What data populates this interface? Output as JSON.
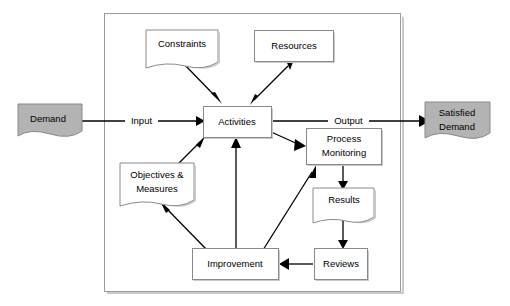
{
  "diagram": {
    "type": "process-flow-diagram",
    "colors": {
      "wave_fill": "#b3b3b3",
      "box_fill": "#ffffff",
      "box_stroke": "#8a8a8a",
      "container_stroke": "#9a9a9a",
      "connector": "#000000",
      "shadow": "#c9c9c9"
    },
    "container": {
      "name": "process-boundary",
      "x": 104,
      "y": 13,
      "width": 296,
      "height": 278
    },
    "nodes": [
      {
        "id": "demand",
        "label": "Demand",
        "shape": "wave",
        "fill": "#b3b3b3",
        "x": 18,
        "y": 104,
        "width": 64,
        "height": 34
      },
      {
        "id": "constraints",
        "label": "Constraints",
        "shape": "document",
        "fill": "#ffffff",
        "x": 146,
        "y": 30,
        "width": 72,
        "height": 32
      },
      {
        "id": "resources",
        "label": "Resources",
        "shape": "rect",
        "fill": "#ffffff",
        "x": 254,
        "y": 30,
        "width": 79,
        "height": 31
      },
      {
        "id": "activities",
        "label": "Activities",
        "shape": "rect",
        "fill": "#ffffff",
        "x": 203,
        "y": 106,
        "width": 68,
        "height": 31
      },
      {
        "id": "process-monitoring",
        "label_line_1": "Process",
        "label_line_2": "Monitoring",
        "label": "Process Monitoring",
        "shape": "rect",
        "fill": "#ffffff",
        "x": 306,
        "y": 128,
        "width": 75,
        "height": 36
      },
      {
        "id": "objectives-measures",
        "label_line_1": "Objectives &",
        "label_line_2": "Measures",
        "label": "Objectives & Measures",
        "shape": "document",
        "fill": "#ffffff",
        "x": 120,
        "y": 163,
        "width": 74,
        "height": 37
      },
      {
        "id": "results",
        "label": "Results",
        "shape": "document",
        "fill": "#ffffff",
        "x": 313,
        "y": 188,
        "width": 61,
        "height": 29
      },
      {
        "id": "improvement",
        "label": "Improvement",
        "shape": "rect",
        "fill": "#ffffff",
        "x": 192,
        "y": 248,
        "width": 86,
        "height": 31
      },
      {
        "id": "reviews",
        "label": "Reviews",
        "shape": "rect",
        "fill": "#ffffff",
        "x": 314,
        "y": 248,
        "width": 53,
        "height": 31
      },
      {
        "id": "satisfied-demand",
        "label_line_1": "Satisfied",
        "label_line_2": "Demand",
        "label": "Satisfied Demand",
        "shape": "wave",
        "fill": "#b3b3b3",
        "x": 425,
        "y": 102,
        "width": 65,
        "height": 38
      }
    ],
    "flow_labels": [
      {
        "id": "input",
        "text": "Input",
        "x": 141,
        "y": 121
      },
      {
        "id": "output",
        "text": "Output",
        "x": 348,
        "y": 120
      }
    ],
    "connections": [
      {
        "from": "demand",
        "to": "activities",
        "label": "Input",
        "style": "solid-arrow"
      },
      {
        "from": "activities",
        "to": "satisfied-demand",
        "label": "Output",
        "style": "solid-arrow"
      },
      {
        "from": "constraints",
        "to": "activities",
        "label": "",
        "style": "solid-arrow"
      },
      {
        "from": "resources",
        "to": "activities",
        "label": "",
        "style": "double-arrow"
      },
      {
        "from": "activities",
        "to": "process-monitoring",
        "label": "",
        "style": "solid-arrow"
      },
      {
        "from": "objectives-measures",
        "to": "activities",
        "label": "",
        "style": "solid-arrow"
      },
      {
        "from": "improvement",
        "to": "activities",
        "label": "",
        "style": "solid-arrow"
      },
      {
        "from": "improvement",
        "to": "objectives-measures",
        "label": "",
        "style": "solid-arrow"
      },
      {
        "from": "improvement",
        "to": "process-monitoring",
        "label": "",
        "style": "solid-arrow"
      },
      {
        "from": "process-monitoring",
        "to": "results",
        "label": "",
        "style": "solid-arrow"
      },
      {
        "from": "results",
        "to": "reviews",
        "label": "",
        "style": "solid-arrow"
      },
      {
        "from": "reviews",
        "to": "improvement",
        "label": "",
        "style": "solid-arrow"
      }
    ]
  }
}
